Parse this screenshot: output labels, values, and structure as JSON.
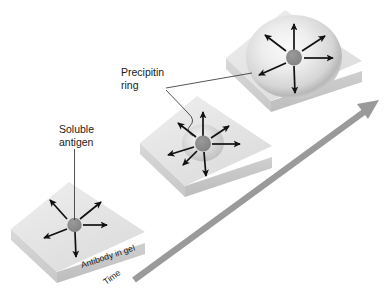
{
  "figure": {
    "background_color": "#ffffff"
  },
  "labels": {
    "soluble_antigen_line1": "Soluble",
    "soluble_antigen_line2": "antigen",
    "precipitin_ring_line1": "Precipitin",
    "precipitin_ring_line2": "ring",
    "antibody_in_gel": "Antibody in gel",
    "time": "Time"
  },
  "colors": {
    "gel_top": "#e6e6e6",
    "gel_side_left": "#d2d2d2",
    "gel_side_front": "#c4c4c4",
    "antigen_dot": "#8c8c8c",
    "ring_edge": "#b5b5b5",
    "ring_center": "#f2f2f2",
    "arrow": "#111111",
    "time_arrow": "#9a9a9a",
    "leader": "#2a2a2a",
    "text": "#1a1a1a"
  },
  "stages": [
    {
      "name": "stage-1-early",
      "order": 1,
      "ring_present": false,
      "ring_radius": 0,
      "antigen_dot_radius": 7,
      "description": "Soluble antigen placed in well, begins diffusing into antibody gel",
      "arrow_count": 6
    },
    {
      "name": "stage-2-intermediate",
      "order": 2,
      "ring_present": true,
      "ring_radius": 18,
      "antigen_dot_radius": 8,
      "description": "Small precipitin ring forms as antigen diffuses outward",
      "arrow_count": 7
    },
    {
      "name": "stage-3-late",
      "order": 3,
      "ring_present": true,
      "ring_radius": 44,
      "antigen_dot_radius": 8,
      "description": "Large precipitin ring at equivalence",
      "arrow_count": 6
    }
  ],
  "time_axis": {
    "label": "Time",
    "direction": "lower-left to upper-right"
  }
}
